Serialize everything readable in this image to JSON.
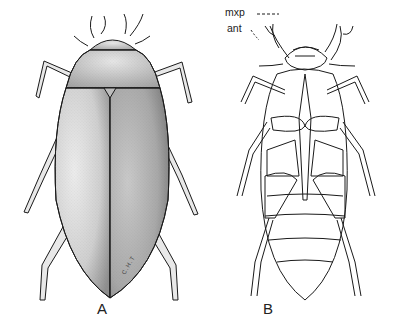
{
  "figure": {
    "panels": [
      {
        "id": "A",
        "label": "A",
        "view": "dorsal view of water beetle",
        "signature": "C.H.T"
      },
      {
        "id": "B",
        "label": "B",
        "view": "ventral view of water beetle",
        "annotations": [
          {
            "text": "mxp"
          },
          {
            "text": "ant"
          }
        ]
      }
    ],
    "colors": {
      "ink": "#1a1a1a",
      "stipple_light": "#d6d6d6",
      "stipple_dark": "#9a9a9a",
      "background": "#ffffff"
    }
  }
}
